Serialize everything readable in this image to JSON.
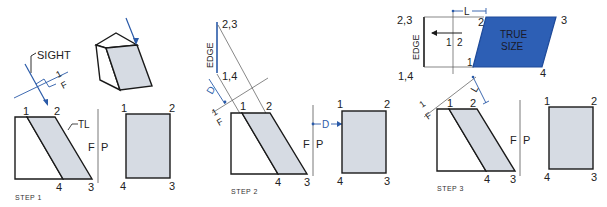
{
  "figure": {
    "colors": {
      "line": "#1a1a1a",
      "construction": "#555555",
      "blue": "#2a5aa8",
      "shade": "#d6dbe3",
      "true_size_fill": "#2d5fb5"
    },
    "step1": {
      "caption": "STEP 1",
      "sight_label": "SIGHT",
      "fold_label_top": "1",
      "fold_label_bottom": "F",
      "tl_label": "TL",
      "fp_left": "F",
      "fp_right": "P",
      "front": {
        "p1": "1",
        "p2": "2",
        "p3": "3",
        "p4": "4"
      },
      "profile": {
        "p1": "1",
        "p2": "2",
        "p3": "3",
        "p4": "4"
      }
    },
    "step2": {
      "caption": "STEP 2",
      "edge_label": "EDGE",
      "top_point": "2,3",
      "bottom_point": "1,4",
      "d_label": "D",
      "d_label_right": "D",
      "fold_label_top": "1",
      "fold_label_bottom": "F",
      "fp_left": "F",
      "fp_right": "P",
      "front": {
        "p1": "1",
        "p2": "2",
        "p3": "3",
        "p4": "4"
      },
      "profile": {
        "p1": "1",
        "p2": "2",
        "p3": "3",
        "p4": "4"
      }
    },
    "step3": {
      "caption": "STEP 3",
      "edge_label": "EDGE",
      "top_point": "2,3",
      "bottom_point": "1,4",
      "l_label": "L",
      "l_label_lower": "L",
      "fold_12_left": "1",
      "fold_12_right": "2",
      "true_size_line1": "TRUE",
      "true_size_line2": "SIZE",
      "aux": {
        "p1": "1",
        "p2": "2",
        "p3": "3",
        "p4": "4"
      },
      "fold_label_top": "1",
      "fold_label_bottom": "F",
      "fp_left": "F",
      "fp_right": "P",
      "front": {
        "p1": "1",
        "p2": "2",
        "p3": "3",
        "p4": "4"
      },
      "profile": {
        "p1": "1",
        "p2": "2",
        "p3": "3",
        "p4": "4"
      }
    }
  }
}
